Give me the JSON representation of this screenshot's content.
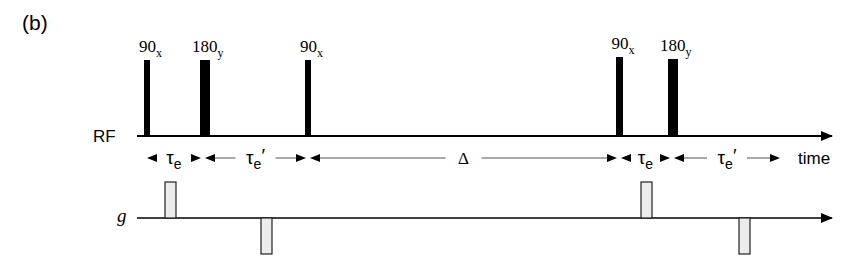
{
  "figure": {
    "panel_label": "(b)",
    "colors": {
      "ink": "#000000",
      "gradient_fill": "#ececec",
      "gradient_stroke": "#222222",
      "interval_line": "#555555"
    }
  },
  "rf": {
    "axis_label": "RF",
    "pulses": [
      {
        "angle": "90",
        "phase": "x",
        "type": "90"
      },
      {
        "angle": "180",
        "phase": "y",
        "type": "180"
      },
      {
        "angle": "90",
        "phase": "x",
        "type": "90"
      },
      {
        "angle": "90",
        "phase": "x",
        "type": "90"
      },
      {
        "angle": "180",
        "phase": "y",
        "type": "180"
      }
    ]
  },
  "timing": {
    "axis_label": "time",
    "intervals": [
      {
        "symbol": "τ",
        "subscript": "e",
        "prime": ""
      },
      {
        "symbol": "τ",
        "subscript": "e",
        "prime": "′"
      },
      {
        "symbol": "Δ",
        "subscript": "",
        "prime": ""
      },
      {
        "symbol": "τ",
        "subscript": "e",
        "prime": ""
      },
      {
        "symbol": "τ",
        "subscript": "e",
        "prime": "′"
      }
    ]
  },
  "gradient": {
    "axis_label": "g",
    "lobes": [
      {
        "polarity": "positive"
      },
      {
        "polarity": "negative"
      },
      {
        "polarity": "positive"
      },
      {
        "polarity": "negative"
      }
    ]
  }
}
